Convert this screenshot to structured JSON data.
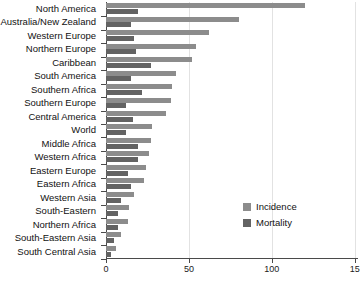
{
  "chart_data": {
    "type": "bar",
    "orientation": "horizontal",
    "title": "",
    "xlabel": "",
    "ylabel": "",
    "xlim": [
      0,
      152
    ],
    "ticks": [
      0,
      50,
      100,
      150
    ],
    "tick_labels": [
      "0",
      "50",
      "100",
      "15"
    ],
    "grid": true,
    "legend_position": "inside-right",
    "categories": [
      "North America",
      "Australia/New Zealand",
      "Western Europe",
      "Northern Europe",
      "Caribbean",
      "South America",
      "Southern Africa",
      "Southern Europe",
      "Central America",
      "World",
      "Middle Africa",
      "Western Africa",
      "Eastern Europe",
      "Eastern Africa",
      "Western Asia",
      "South-Eastern",
      "Northern Africa",
      "South-Eastern Asia",
      "South Central Asia"
    ],
    "series": [
      {
        "name": "Incidence",
        "color": "#8c8c8c",
        "values": [
          120,
          80,
          62,
          54,
          52,
          42,
          40,
          39,
          36,
          28,
          27,
          26,
          24,
          23,
          17,
          14,
          13,
          9,
          6
        ]
      },
      {
        "name": "Mortality",
        "color": "#636363",
        "values": [
          19,
          15,
          17,
          18,
          27,
          15,
          22,
          12,
          16,
          12,
          19,
          19,
          13,
          15,
          9,
          7,
          7,
          5,
          3
        ]
      }
    ]
  },
  "legend": {
    "items": [
      {
        "label": "Incidence"
      },
      {
        "label": "Mortality"
      }
    ]
  },
  "axis": {
    "title": ""
  }
}
